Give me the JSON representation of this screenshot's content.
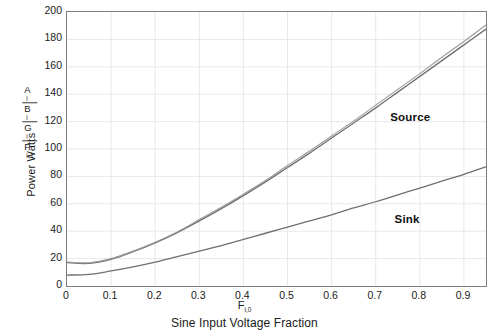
{
  "chart_data": {
    "type": "line",
    "title": "",
    "xlabel": "Sine Input Voltage Fraction",
    "xlabel_symbol": "F",
    "xlabel_symbol_sub": "i,0",
    "ylabel": "Power Watts",
    "ylabel_stack": [
      "A",
      "B",
      "G",
      "P"
    ],
    "ylabel_stack_subs": [
      "i",
      "i",
      "i",
      "i,1"
    ],
    "xlim": [
      0,
      0.95
    ],
    "ylim": [
      0,
      200
    ],
    "xticks": [
      0,
      0.1,
      0.2,
      0.3,
      0.4,
      0.5,
      0.6,
      0.7,
      0.8,
      0.9
    ],
    "xticklabels": [
      "0",
      "0.1",
      "0.2",
      "0.3",
      "0.4",
      "0.5",
      "0.6",
      "0.7",
      "0.8",
      "0.9"
    ],
    "yticks": [
      0,
      20,
      40,
      60,
      80,
      100,
      120,
      140,
      160,
      180,
      200
    ],
    "yticklabels": [
      "0",
      "20",
      "40",
      "60",
      "80",
      "100",
      "120",
      "140",
      "160",
      "180",
      "200"
    ],
    "grid": true,
    "grid_color": "#e8e8e8",
    "frame_color": "#7d7d7d",
    "legend_position": "inline-annotation",
    "x": [
      0.0,
      0.05,
      0.1,
      0.15,
      0.2,
      0.25,
      0.3,
      0.35,
      0.4,
      0.45,
      0.5,
      0.55,
      0.6,
      0.65,
      0.7,
      0.75,
      0.8,
      0.85,
      0.9,
      0.95
    ],
    "series": [
      {
        "name": "Source",
        "label": "Source",
        "color": "#6f6f6f",
        "values": [
          17.0,
          16.5,
          19.5,
          25.0,
          31.5,
          39.0,
          47.5,
          56.5,
          66.0,
          76.0,
          86.5,
          97.0,
          108.0,
          119.0,
          130.0,
          141.5,
          153.0,
          164.5,
          176.0,
          187.5
        ]
      },
      {
        "name": "Source (second trace)",
        "label": "Source",
        "color": "#9a9a9a",
        "values": [
          17.5,
          17.0,
          20.0,
          25.5,
          32.0,
          39.5,
          48.5,
          57.5,
          67.0,
          77.0,
          88.0,
          98.5,
          109.5,
          120.5,
          132.0,
          143.5,
          155.0,
          167.0,
          178.5,
          190.5
        ]
      },
      {
        "name": "Sink",
        "label": "Sink",
        "color": "#6f6f6f",
        "values": [
          8.0,
          8.5,
          11.0,
          14.0,
          17.5,
          21.5,
          25.5,
          29.5,
          34.0,
          38.5,
          43.0,
          47.5,
          52.0,
          57.0,
          61.5,
          66.5,
          71.5,
          76.5,
          81.5,
          87.0
        ]
      }
    ],
    "annotations": [
      {
        "text": "Source",
        "x": 0.735,
        "y": 121
      },
      {
        "text": "Sink",
        "x": 0.745,
        "y": 47
      }
    ]
  }
}
